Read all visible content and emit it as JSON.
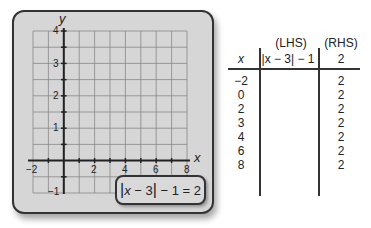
{
  "graph": {
    "axis_x_label": "x",
    "axis_y_label": "y",
    "x_ticks": [
      "−2",
      "2",
      "4",
      "6",
      "8"
    ],
    "y_ticks": [
      "4",
      "3",
      "2",
      "1",
      "−1"
    ],
    "x_range": [
      -2,
      8
    ],
    "y_range": [
      -1,
      4
    ]
  },
  "equation": {
    "abs_open": "|",
    "var": "x",
    "inner": " − 3",
    "abs_close": "|",
    "rest": " − 1 = 2"
  },
  "table": {
    "header_lhs_tag": "(LHS)",
    "header_rhs_tag": "(RHS)",
    "header_x": "x",
    "header_lhs": "|x − 3| − 1",
    "header_rhs": "2",
    "rows": [
      {
        "x": "−2",
        "lhs": "",
        "rhs": "2"
      },
      {
        "x": "0",
        "lhs": "",
        "rhs": "2"
      },
      {
        "x": "2",
        "lhs": "",
        "rhs": "2"
      },
      {
        "x": "3",
        "lhs": "",
        "rhs": "2"
      },
      {
        "x": "4",
        "lhs": "",
        "rhs": "2"
      },
      {
        "x": "6",
        "lhs": "",
        "rhs": "2"
      },
      {
        "x": "8",
        "lhs": "",
        "rhs": "2"
      }
    ]
  }
}
